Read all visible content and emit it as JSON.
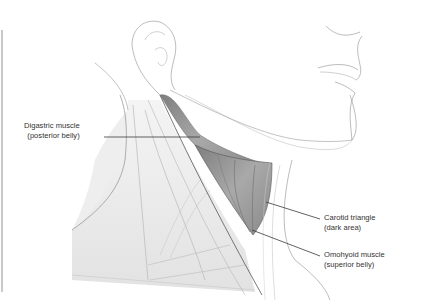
{
  "figure": {
    "labels": [
      {
        "id": "digastric",
        "line1": "Digastric muscle",
        "line2": "(posterior belly)"
      },
      {
        "id": "carotid",
        "line1": "Carotid triangle",
        "line2": "(dark area)"
      },
      {
        "id": "omohyoid",
        "line1": "Omohyoid muscle",
        "line2": "(superior belly)"
      }
    ]
  },
  "colors": {
    "line": "#3a3a3a",
    "sketch": "#9a9a9a",
    "muscle_dark": "#8c8c8c",
    "muscle_mid": "#b5b5b5",
    "skin_shade": "#e6e6e6",
    "text": "#333333"
  }
}
